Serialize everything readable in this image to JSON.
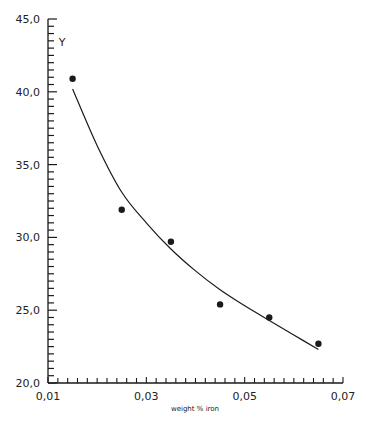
{
  "chart_data": {
    "type": "scatter",
    "title": "",
    "xlabel": "weight % iron",
    "ylabel": "Y",
    "xlim": [
      0.01,
      0.07
    ],
    "ylim": [
      20.0,
      45.0
    ],
    "grid": false,
    "legend": null,
    "x_ticks": [
      "0,01",
      "0,03",
      "0,05",
      "0,07"
    ],
    "x_tick_values": [
      0.01,
      0.03,
      0.05,
      0.07
    ],
    "x_minor_step": 0.002,
    "y_ticks": [
      "20,0",
      "25,0",
      "30,0",
      "35,0",
      "40,0",
      "45,0"
    ],
    "y_tick_values": [
      20,
      25,
      30,
      35,
      40,
      45
    ],
    "y_minor_step": 0.5,
    "series": [
      {
        "name": "measured",
        "kind": "scatter",
        "x": [
          0.015,
          0.025,
          0.035,
          0.045,
          0.055,
          0.065
        ],
        "y": [
          40.9,
          31.9,
          29.7,
          25.4,
          24.5,
          22.7
        ]
      },
      {
        "name": "fitted curve",
        "kind": "line",
        "x": [
          0.015,
          0.02,
          0.025,
          0.03,
          0.035,
          0.04,
          0.045,
          0.05,
          0.055,
          0.06,
          0.065
        ],
        "y": [
          40.2,
          36.3,
          33.1,
          31.0,
          29.2,
          27.7,
          26.4,
          25.3,
          24.3,
          23.3,
          22.3
        ]
      }
    ]
  },
  "colors": {
    "background": "#ffffff",
    "ink": "#1a1a1a"
  }
}
